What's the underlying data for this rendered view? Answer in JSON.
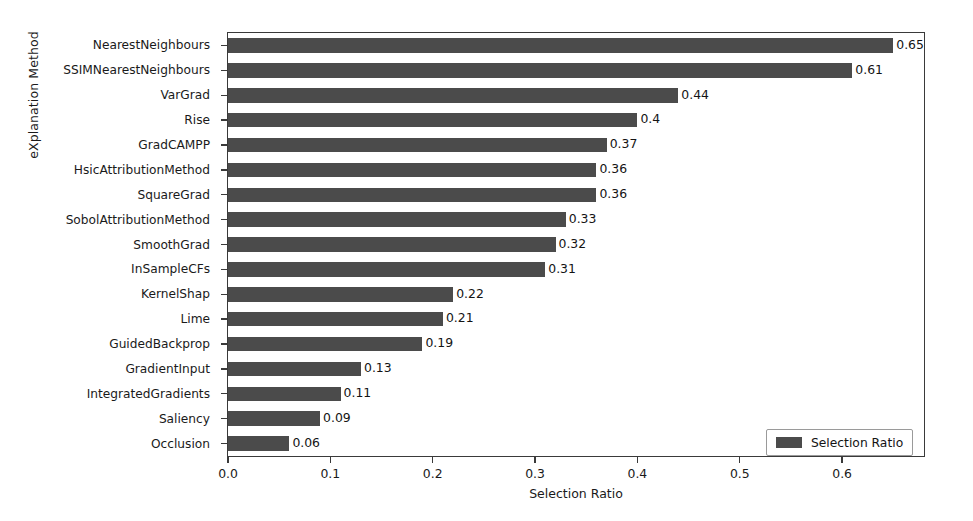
{
  "chart_data": {
    "type": "bar",
    "orientation": "horizontal",
    "title": "",
    "xlabel": "Selection Ratio",
    "ylabel": "eXplanation Method",
    "xlim": [
      0.0,
      0.68
    ],
    "xticks": [
      "0.0",
      "0.1",
      "0.2",
      "0.3",
      "0.4",
      "0.5",
      "0.6"
    ],
    "xtick_values": [
      0.0,
      0.1,
      0.2,
      0.3,
      0.4,
      0.5,
      0.6
    ],
    "grid": false,
    "legend": {
      "position": "lower right",
      "entries": [
        {
          "label": "Selection Ratio",
          "color": "#4b4b4b"
        }
      ]
    },
    "bar_color": "#4b4b4b",
    "categories": [
      "NearestNeighbours",
      "SSIMNearestNeighbours",
      "VarGrad",
      "Rise",
      "GradCAMPP",
      "HsicAttributionMethod",
      "SquareGrad",
      "SobolAttributionMethod",
      "SmoothGrad",
      "InSampleCFs",
      "KernelShap",
      "Lime",
      "GuidedBackprop",
      "GradientInput",
      "IntegratedGradients",
      "Saliency",
      "Occlusion"
    ],
    "values": [
      0.65,
      0.61,
      0.44,
      0.4,
      0.37,
      0.36,
      0.36,
      0.33,
      0.32,
      0.31,
      0.22,
      0.21,
      0.19,
      0.13,
      0.11,
      0.09,
      0.06
    ],
    "value_labels": [
      "0.65",
      "0.61",
      "0.44",
      "0.4",
      "0.37",
      "0.36",
      "0.36",
      "0.33",
      "0.32",
      "0.31",
      "0.22",
      "0.21",
      "0.19",
      "0.13",
      "0.11",
      "0.09",
      "0.06"
    ]
  }
}
